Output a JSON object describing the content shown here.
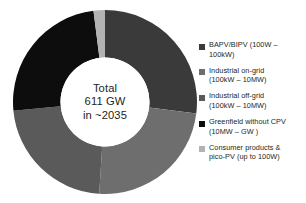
{
  "chart_data": {
    "type": "pie",
    "title": "",
    "subtitle": "",
    "xlabel": "",
    "ylabel": "",
    "legend_position": "right",
    "grid": false,
    "donut": true,
    "inner_radius_ratio": 0.48,
    "center_label": {
      "line1": "Total",
      "line2": "611 GW",
      "line3": "in ~2035"
    },
    "total": 611,
    "units": "GW",
    "year": "~2035",
    "categories": [
      "BAPV/BIPV (100W – 100kW)",
      "Industrial on-grid (100kW – 10MW)",
      "Industrial off-grid (100kW – 10MW)",
      "Greenfield without CPV (10MW – GW )",
      "Consumer products & pico-PV (up to 100W)"
    ],
    "values": [
      27,
      24,
      22.5,
      24.5,
      2
    ],
    "colors": [
      "#3a3a3a",
      "#6e6e6e",
      "#5a5a5a",
      "#0d0d0d",
      "#b3b3b3"
    ],
    "start_angles": [
      0,
      97.2,
      183.6,
      264.6,
      352.8
    ],
    "sweep_angles": [
      97.2,
      86.4,
      81.0,
      88.2,
      7.2
    ]
  },
  "legend": {
    "items": [
      {
        "color": "#3a3a3a",
        "swatch_name": "legend-swatch-bapv-bipv",
        "line1": "BAPV/BIPV (100W –",
        "line2": "100kW)"
      },
      {
        "color": "#6e6e6e",
        "swatch_name": "legend-swatch-industrial-on-grid",
        "line1": "Industrial on-grid",
        "line2": "(100kW – 10MW)"
      },
      {
        "color": "#5a5a5a",
        "swatch_name": "legend-swatch-industrial-off-grid",
        "line1": "Industrial off-grid",
        "line2": "(100kW – 10MW)"
      },
      {
        "color": "#0d0d0d",
        "swatch_name": "legend-swatch-greenfield",
        "line1": "Greenfield without CPV",
        "line2": "(10MW – GW )"
      },
      {
        "color": "#b3b3b3",
        "swatch_name": "legend-swatch-consumer-pico-pv",
        "line1": "Consumer products &",
        "line2": "pico-PV (up to 100W)"
      }
    ]
  }
}
